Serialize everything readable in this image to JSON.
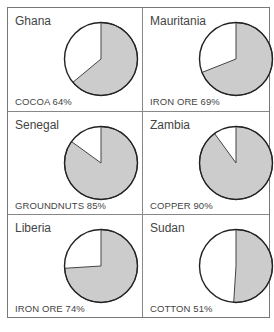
{
  "chart_data": [
    {
      "type": "pie",
      "title": "Ghana",
      "categories": [
        "Cocoa",
        "Other exports"
      ],
      "values": [
        64,
        36
      ],
      "label": "COCOA 64%"
    },
    {
      "type": "pie",
      "title": "Mauritania",
      "categories": [
        "Iron ore",
        "Other exports"
      ],
      "values": [
        69,
        31
      ],
      "label": "IRON ORE 69%"
    },
    {
      "type": "pie",
      "title": "Senegal",
      "categories": [
        "Groundnuts",
        "Other exports"
      ],
      "values": [
        85,
        15
      ],
      "label": "GROUNDNUTS 85%"
    },
    {
      "type": "pie",
      "title": "Zambia",
      "categories": [
        "Copper",
        "Other exports"
      ],
      "values": [
        90,
        10
      ],
      "label": "COPPER 90%"
    },
    {
      "type": "pie",
      "title": "Liberia",
      "categories": [
        "Iron ore",
        "Other exports"
      ],
      "values": [
        74,
        26
      ],
      "label": "IRON ORE 74%"
    },
    {
      "type": "pie",
      "title": "Sudan",
      "categories": [
        "Cotton",
        "Other exports"
      ],
      "values": [
        51,
        49
      ],
      "label": "COTTON 51%"
    }
  ],
  "panels": [
    {
      "country": "Ghana",
      "commodity": "COCOA 64%",
      "percent": 64
    },
    {
      "country": "Mauritania",
      "commodity": "IRON ORE 69%",
      "percent": 69
    },
    {
      "country": "Senegal",
      "commodity": "GROUNDNUTS 85%",
      "percent": 85
    },
    {
      "country": "Zambia",
      "commodity": "COPPER 90%",
      "percent": 90
    },
    {
      "country": "Liberia",
      "commodity": "IRON ORE 74%",
      "percent": 74
    },
    {
      "country": "Sudan",
      "commodity": "COTTON 51%",
      "percent": 51
    }
  ],
  "colors": {
    "slice": "#cccccc",
    "rest": "#ffffff",
    "stroke": "#222222",
    "border": "#777777"
  }
}
